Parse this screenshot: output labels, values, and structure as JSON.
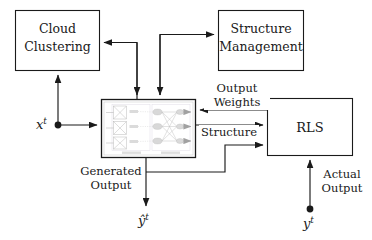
{
  "figure": {
    "type": "block-diagram",
    "background_color": "#ffffff",
    "line_color": "#1a1a1a",
    "text_color": "#1a1a1a"
  },
  "blocks": {
    "cloud_clustering": {
      "line1": "Cloud",
      "line2": "Clustering"
    },
    "structure_management": {
      "line1": "Structure",
      "line2": "Management"
    },
    "network": {
      "label": "",
      "inner_panel_left_caption": "",
      "inner_panel_right_caption": ""
    },
    "rls": {
      "label": "RLS"
    }
  },
  "edge_labels": {
    "output_weights_line1": "Output",
    "output_weights_line2": "Weights",
    "structure": "Structure",
    "generated_output_line1": "Generated",
    "generated_output_line2": "Output",
    "actual_output_line1": "Actual",
    "actual_output_line2": "Output"
  },
  "signals": {
    "input_x": {
      "base": "x",
      "superscript": "t"
    },
    "target_y": {
      "base": "y",
      "superscript": "t"
    },
    "predicted_y": {
      "base": "ŷ",
      "superscript": "t"
    }
  },
  "icons": {
    "arrow": "arrowhead-icon",
    "junction": "signal-dot-icon"
  }
}
